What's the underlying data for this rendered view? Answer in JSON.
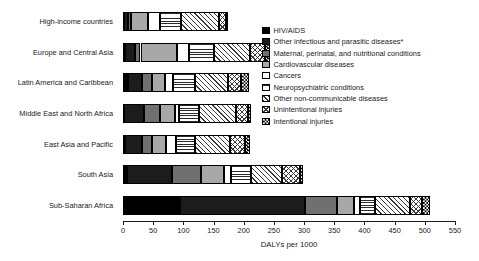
{
  "chart_data": {
    "type": "bar",
    "orientation": "horizontal",
    "stacked": true,
    "title": "",
    "xlabel": "DALYs per 1000",
    "ylabel": "",
    "xlim": [
      0,
      550
    ],
    "xticks": [
      0,
      50,
      100,
      150,
      200,
      250,
      300,
      350,
      400,
      450,
      500,
      550
    ],
    "grid": false,
    "legend_position": "upper right",
    "categories": [
      "High-income countries",
      "Europe and Central Asia",
      "Latin America and Caribbean",
      "Middle East and North Africa",
      "East Asia and Pacific",
      "South Asia",
      "Sub-Saharan Africa"
    ],
    "series": [
      {
        "name": "HIV/AIDS",
        "pattern": "solid-black",
        "color": "#000000",
        "values": [
          2,
          3,
          8,
          2,
          4,
          6,
          95
        ]
      },
      {
        "name": "Other infectious and parasitic diseases*",
        "pattern": "solid-dark",
        "color": "#1c1c1c",
        "values": [
          6,
          17,
          24,
          32,
          28,
          75,
          207
        ]
      },
      {
        "name": "Maternal, perinatal, and nutritional conditions",
        "pattern": "solid-mid-gray",
        "color": "#707070",
        "values": [
          5,
          9,
          16,
          27,
          16,
          49,
          53
        ]
      },
      {
        "name": "Cardiovascular diseases",
        "pattern": "solid-light-gray",
        "color": "#a8a8a8",
        "values": [
          28,
          61,
          21,
          25,
          24,
          38,
          27
        ]
      },
      {
        "name": "Cancers",
        "pattern": "white",
        "color": "#ffffff",
        "values": [
          20,
          20,
          14,
          7,
          15,
          11,
          10
        ]
      },
      {
        "name": "Neuropsychiatric conditions",
        "pattern": "horizontal-lines",
        "color": "#2b2b2b",
        "values": [
          35,
          40,
          36,
          33,
          32,
          33,
          26
        ]
      },
      {
        "name": "Other non-communicable diseases",
        "pattern": "diagonal-hatch",
        "color": "#3a3a3a",
        "values": [
          63,
          60,
          55,
          62,
          58,
          52,
          58
        ]
      },
      {
        "name": "Unintentional injuries",
        "pattern": "cross-hatch",
        "color": "#3a3a3a",
        "values": [
          11,
          25,
          21,
          19,
          25,
          29,
          19
        ]
      },
      {
        "name": "Intentional injuries",
        "pattern": "checkerboard",
        "color": "#000000",
        "values": [
          4,
          9,
          13,
          5,
          9,
          6,
          13
        ]
      }
    ]
  }
}
